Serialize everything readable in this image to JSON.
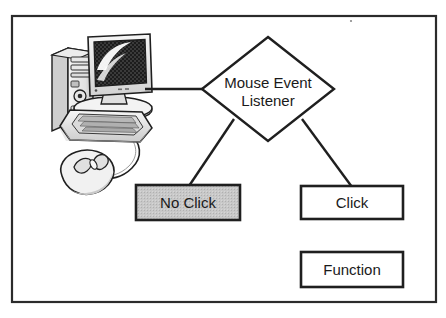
{
  "figure": {
    "kind": "flow-diagram",
    "background_color": "#ffffff",
    "frame": {
      "label": "diagram-border",
      "x": 11,
      "y": 15,
      "width": 426,
      "height": 288,
      "stroke_color": "#2b2b2b",
      "fill_color": "#ffffff",
      "stroke_width": 2
    }
  },
  "illustration": {
    "name": "desktop-computer-clipart",
    "description": "Desktop computer with tower, CRT/LCD monitor, keyboard and wired mouse",
    "parts": [
      "computer-tower",
      "computer-monitor",
      "monitor-screen",
      "computer-keyboard",
      "computer-mouse",
      "mouse-cable"
    ],
    "colors": {
      "outline": "#1f1f1f",
      "body_light": "#f2f2f2",
      "body_mid": "#d8d8d8",
      "body_shade": "#b9b9b9",
      "screen_dark": "#2e2e2e",
      "screen_highlight": "#ffffff"
    }
  },
  "nodes": {
    "decision": {
      "id": "mouse-event-listener",
      "shape": "diamond",
      "label_line1": "Mouse Event",
      "label_line2": "Listener",
      "cx": 268,
      "cy": 89,
      "rx": 66,
      "ry": 52,
      "fill_color": "#ffffff",
      "stroke_color": "#1f1f1f",
      "font_size": 15
    },
    "boxes": [
      {
        "id": "no-click",
        "label": "No Click",
        "x": 136,
        "y": 185,
        "width": 104,
        "height": 35,
        "fill_color": "#c3c3c3",
        "stroke_color": "#1f1f1f",
        "font_size": 15
      },
      {
        "id": "click",
        "label": "Click",
        "x": 301,
        "y": 186,
        "width": 102,
        "height": 33,
        "fill_color": "#ffffff",
        "stroke_color": "#1f1f1f",
        "font_size": 15
      },
      {
        "id": "function",
        "label": "Function",
        "x": 301,
        "y": 252,
        "width": 102,
        "height": 35,
        "fill_color": "#ffffff",
        "stroke_color": "#1f1f1f",
        "font_size": 15
      }
    ]
  },
  "connectors": [
    {
      "id": "computer-to-listener",
      "from": "computer-monitor",
      "to": "mouse-event-listener",
      "orientation": "horizontal",
      "x1": 145,
      "y1": 89,
      "x2": 202,
      "y2": 89,
      "stroke_color": "#1f1f1f"
    },
    {
      "id": "listener-to-no-click",
      "from": "mouse-event-listener",
      "to": "no-click",
      "orientation": "diagonal",
      "x1": 233,
      "y1": 120,
      "x2": 189,
      "y2": 185,
      "stroke_color": "#1f1f1f"
    },
    {
      "id": "listener-to-click",
      "from": "mouse-event-listener",
      "to": "click",
      "orientation": "diagonal",
      "x1": 303,
      "y1": 120,
      "x2": 352,
      "y2": 186,
      "stroke_color": "#1f1f1f"
    }
  ]
}
